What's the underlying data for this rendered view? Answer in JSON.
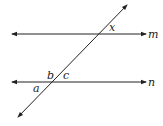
{
  "diagram": {
    "type": "parallel-lines-transversal",
    "lines": [
      {
        "id": "m",
        "label": "m",
        "x1": 12,
        "y1": 34,
        "x2": 146,
        "y2": 34
      },
      {
        "id": "n",
        "label": "n",
        "x1": 12,
        "y1": 82,
        "x2": 146,
        "y2": 82
      },
      {
        "id": "transversal",
        "label": "",
        "x1": 18,
        "y1": 117,
        "x2": 127,
        "y2": 5
      }
    ],
    "angle_labels": [
      {
        "id": "x",
        "text": "x",
        "x": 109,
        "y": 31
      },
      {
        "id": "b",
        "text": "b",
        "x": 47,
        "y": 79
      },
      {
        "id": "c",
        "text": "c",
        "x": 63,
        "y": 79
      },
      {
        "id": "a",
        "text": "a",
        "x": 33,
        "y": 92
      }
    ],
    "line_labels": [
      {
        "id": "m",
        "text": "m",
        "x": 148,
        "y": 38
      },
      {
        "id": "n",
        "text": "n",
        "x": 148,
        "y": 86
      }
    ],
    "stroke_color": "#222222"
  }
}
